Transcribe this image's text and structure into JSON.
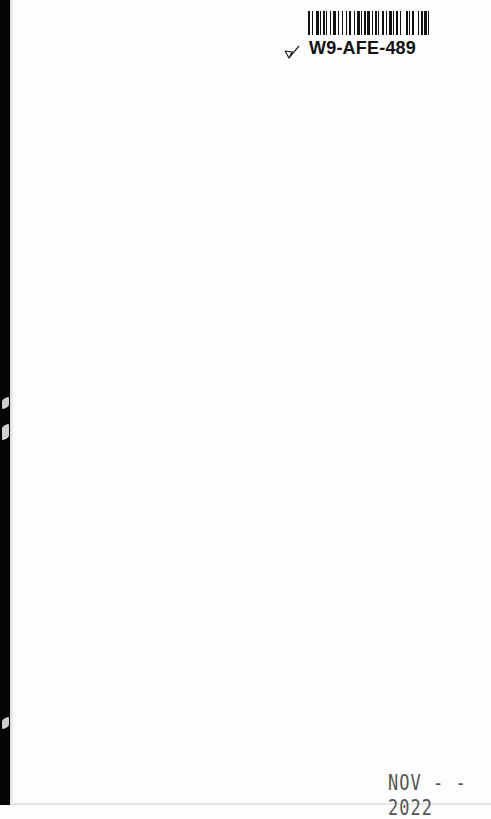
{
  "page": {
    "background": "#fdfdfd",
    "binding_edge_color": "#050505"
  },
  "library_label": {
    "barcode_id": "W9-AFE-489",
    "icon": "checkmark-icon"
  },
  "stamp": {
    "date_text": "NOV - - 2022"
  }
}
